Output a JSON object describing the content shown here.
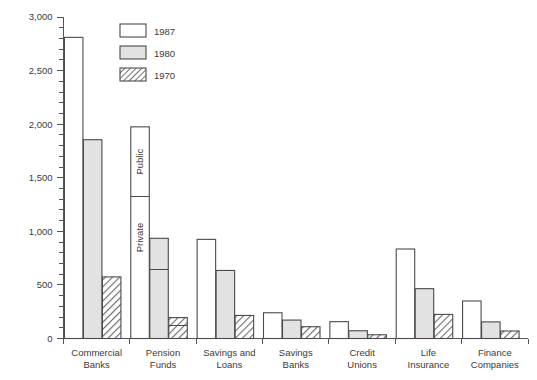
{
  "chart_data": {
    "type": "bar",
    "title": "",
    "xlabel": "",
    "ylabel": "",
    "ylim": [
      0,
      3000
    ],
    "grid": false,
    "legend_position": "top-left-inside",
    "y_major_ticks": [
      0,
      500,
      1000,
      1500,
      2000,
      2500,
      3000
    ],
    "y_tick_labels": [
      "0",
      "500",
      "1,000",
      "1,500",
      "2,000",
      "2,500",
      "3,000"
    ],
    "y_minor_tick_step": 100,
    "categories": [
      "Commercial Banks",
      "Pension Funds",
      "Savings and Loans",
      "Savings Banks",
      "Credit Unions",
      "Life Insurance",
      "Finance Companies"
    ],
    "category_lines": [
      [
        "Commercial",
        "Banks"
      ],
      [
        "Pension",
        "Funds"
      ],
      [
        "Savings and",
        "Loans"
      ],
      [
        "Savings",
        "Banks"
      ],
      [
        "Credit",
        "Unions"
      ],
      [
        "Life",
        "Insurance"
      ],
      [
        "Finance",
        "Companies"
      ]
    ],
    "series": [
      {
        "name": "1987",
        "fill": "white",
        "values": [
          2810,
          1975,
          925,
          240,
          157,
          835,
          350
        ]
      },
      {
        "name": "1980",
        "fill": "light-gray",
        "values": [
          1855,
          935,
          635,
          172,
          72,
          465,
          155
        ]
      },
      {
        "name": "1970",
        "fill": "diagonal-hatch",
        "values": [
          575,
          195,
          215,
          110,
          35,
          225,
          70
        ]
      }
    ],
    "segment_annotations": {
      "category": "Pension Funds",
      "upper_label": "Public",
      "lower_label": "Private",
      "dividers": {
        "1987": 1325,
        "1980": 640,
        "1970": 120
      }
    },
    "colors": {
      "axis": "#555555",
      "bar_outline": "#4a4a4a",
      "fill_1987": "#ffffff",
      "fill_1980": "#e2e2e2",
      "fill_1970_hatch": "#5a5a5a",
      "text": "#3a3a3a",
      "background": "#ffffff"
    }
  },
  "legend": {
    "items": [
      {
        "label": "1987",
        "swatch": "white"
      },
      {
        "label": "1980",
        "swatch": "light-gray"
      },
      {
        "label": "1970",
        "swatch": "diagonal-hatch"
      }
    ]
  }
}
